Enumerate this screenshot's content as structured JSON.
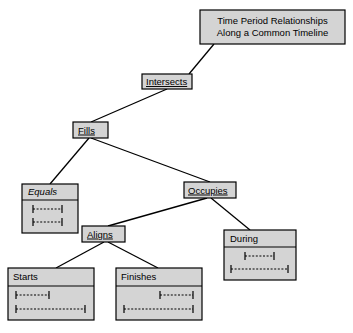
{
  "diagram": {
    "title_box": {
      "line1": "Time Period Relationships",
      "line2": "Along a Common Timeline"
    },
    "colors": {
      "box_fill": "#d4d4d4",
      "box_stroke": "#000000",
      "background": "#ffffff",
      "text": "#000000"
    },
    "nodes": [
      {
        "id": "intersects",
        "label": "Intersects",
        "style": "underline",
        "has_graphic": false
      },
      {
        "id": "fills",
        "label": "Fills",
        "style": "underline",
        "has_graphic": false
      },
      {
        "id": "equals",
        "label": "Equals",
        "style": "italic",
        "has_graphic": true,
        "intervals": [
          {
            "start": 0,
            "end": 100
          },
          {
            "start": 0,
            "end": 100
          }
        ]
      },
      {
        "id": "occupies",
        "label": "Occupies",
        "style": "underline",
        "has_graphic": false
      },
      {
        "id": "aligns",
        "label": "Aligns",
        "style": "underline",
        "has_graphic": false
      },
      {
        "id": "during",
        "label": "During",
        "style": "plain",
        "has_graphic": true,
        "intervals": [
          {
            "start": 25,
            "end": 75
          },
          {
            "start": 0,
            "end": 100
          }
        ]
      },
      {
        "id": "starts",
        "label": "Starts",
        "style": "plain",
        "has_graphic": true,
        "intervals": [
          {
            "start": 0,
            "end": 48
          },
          {
            "start": 0,
            "end": 100
          }
        ]
      },
      {
        "id": "finishes",
        "label": "Finishes",
        "style": "plain",
        "has_graphic": true,
        "intervals": [
          {
            "start": 52,
            "end": 100
          },
          {
            "start": 0,
            "end": 100
          }
        ]
      }
    ],
    "edges": [
      {
        "from": "title",
        "to": "intersects"
      },
      {
        "from": "intersects",
        "to": "fills"
      },
      {
        "from": "fills",
        "to": "equals"
      },
      {
        "from": "fills",
        "to": "occupies"
      },
      {
        "from": "occupies",
        "to": "aligns"
      },
      {
        "from": "occupies",
        "to": "during"
      },
      {
        "from": "aligns",
        "to": "starts"
      },
      {
        "from": "aligns",
        "to": "finishes"
      }
    ]
  }
}
